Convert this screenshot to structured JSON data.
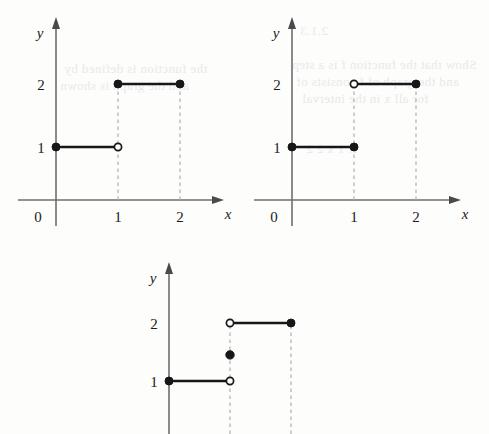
{
  "page": {
    "width": 489,
    "height": 434,
    "background_color": "#fdfdfc",
    "ink_color": "#17171a",
    "axis_color": "#6e6e70",
    "dash_color": "#a9a9ad"
  },
  "bleed_through_text": {
    "note": "faint mirrored show-through from reverse of the scanned page",
    "lines": [
      "the function is defined by",
      "and the graph is shown",
      "for all x in the interval",
      "2.1.3",
      "Show that the function f is a step",
      "and the graph of f consists of",
      "1. 1 x 2 2"
    ]
  },
  "chart_data": [
    {
      "id": "graph-top-left",
      "type": "line",
      "title": "",
      "xlabel": "x",
      "ylabel": "y",
      "xlim": [
        -0.35,
        2.75
      ],
      "ylim": [
        -0.45,
        2.75
      ],
      "xticks": [
        0,
        1,
        2
      ],
      "xtick_labels": [
        "0",
        "1",
        "2"
      ],
      "yticks": [
        1,
        2
      ],
      "ytick_labels": [
        "1",
        "2"
      ],
      "grid": false,
      "legend": null,
      "x_axis_visible": true,
      "segments": [
        {
          "y": 1,
          "x_start": 0,
          "x_end": 1,
          "start_marker": "filled",
          "end_marker": "open"
        },
        {
          "y": 2,
          "x_start": 1,
          "x_end": 2,
          "start_marker": "filled",
          "end_marker": "filled"
        }
      ],
      "isolated_points": [],
      "drop_lines_x": [
        1,
        2
      ]
    },
    {
      "id": "graph-top-right",
      "type": "line",
      "title": "",
      "xlabel": "x",
      "ylabel": "y",
      "xlim": [
        -0.35,
        2.75
      ],
      "ylim": [
        -0.45,
        2.75
      ],
      "xticks": [
        0,
        1,
        2
      ],
      "xtick_labels": [
        "0",
        "1",
        "2"
      ],
      "yticks": [
        1,
        2
      ],
      "ytick_labels": [
        "1",
        "2"
      ],
      "grid": false,
      "legend": null,
      "x_axis_visible": true,
      "segments": [
        {
          "y": 1,
          "x_start": 0,
          "x_end": 1,
          "start_marker": "filled",
          "end_marker": "filled"
        },
        {
          "y": 2,
          "x_start": 1,
          "x_end": 2,
          "start_marker": "open",
          "end_marker": "filled"
        }
      ],
      "isolated_points": [],
      "drop_lines_x": [
        1,
        2
      ]
    },
    {
      "id": "graph-bottom",
      "type": "line",
      "title": "",
      "xlabel": "",
      "ylabel": "y",
      "xlim": [
        -0.35,
        2.75
      ],
      "ylim": [
        -0.45,
        2.75
      ],
      "xticks": [],
      "xtick_labels": [],
      "yticks": [
        1,
        2
      ],
      "ytick_labels": [
        "1",
        "2"
      ],
      "grid": false,
      "legend": null,
      "x_axis_visible": false,
      "segments": [
        {
          "y": 1,
          "x_start": 0,
          "x_end": 1,
          "start_marker": "filled",
          "end_marker": "open"
        },
        {
          "y": 2,
          "x_start": 1,
          "x_end": 2,
          "start_marker": "open",
          "end_marker": "filled"
        }
      ],
      "isolated_points": [
        {
          "x": 1,
          "y": 1.45,
          "marker": "filled"
        }
      ],
      "drop_lines_x": [
        1,
        2
      ]
    }
  ]
}
